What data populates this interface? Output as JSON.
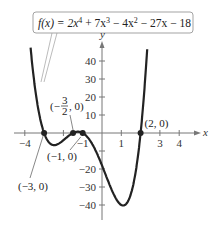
{
  "chart_data": {
    "type": "line",
    "function_label": {
      "prefix": "f(x) = 2x",
      "e1": "4",
      "t2": " + 7x",
      "e2": "3",
      "t3": " − 4x",
      "e3": "2",
      "t4": " − 27x − 18"
    },
    "coefficients": [
      2,
      7,
      -4,
      -27,
      -18
    ],
    "xlabel": "x",
    "ylabel": "y",
    "xlim": [
      -4.3,
      4.6
    ],
    "ylim": [
      -45,
      48
    ],
    "x_ticks": [
      -4,
      -3,
      -2,
      -1,
      1,
      2,
      3,
      4
    ],
    "x_tick_labels": [
      {
        "v": -4,
        "t": "−4"
      },
      {
        "v": -1,
        "t": "−1"
      },
      {
        "v": 1,
        "t": "1"
      },
      {
        "v": 3,
        "t": "3"
      },
      {
        "v": 4,
        "t": "4"
      }
    ],
    "y_ticks": [
      -40,
      -30,
      -20,
      -10,
      10,
      20,
      30,
      40
    ],
    "y_tick_labels": [
      {
        "v": 40,
        "t": "40"
      },
      {
        "v": 30,
        "t": "30"
      },
      {
        "v": 20,
        "t": "20"
      },
      {
        "v": 10,
        "t": "10"
      },
      {
        "v": -20,
        "t": "−20"
      },
      {
        "v": -30,
        "t": "−30"
      },
      {
        "v": -40,
        "t": "−40"
      }
    ],
    "zeros": [
      {
        "x": -3,
        "y": 0,
        "label": "(−3, 0)"
      },
      {
        "x": -1.5,
        "y": 0,
        "label": "(−3/2, 0)"
      },
      {
        "x": -1,
        "y": 0,
        "label": "(−1, 0)"
      },
      {
        "x": 2,
        "y": 0,
        "label": "(2, 0)"
      }
    ],
    "points": [
      {
        "x": -3.3,
        "y": 47
      },
      {
        "x": -3,
        "y": 0
      },
      {
        "x": -2.4,
        "y": -9
      },
      {
        "x": -1.5,
        "y": 0
      },
      {
        "x": -1.2,
        "y": 0.5
      },
      {
        "x": -1,
        "y": 0
      },
      {
        "x": 0,
        "y": -18
      },
      {
        "x": 1.1,
        "y": -41
      },
      {
        "x": 2,
        "y": 0
      },
      {
        "x": 2.3,
        "y": 47
      }
    ],
    "grid": false,
    "legend": "callout box top"
  }
}
